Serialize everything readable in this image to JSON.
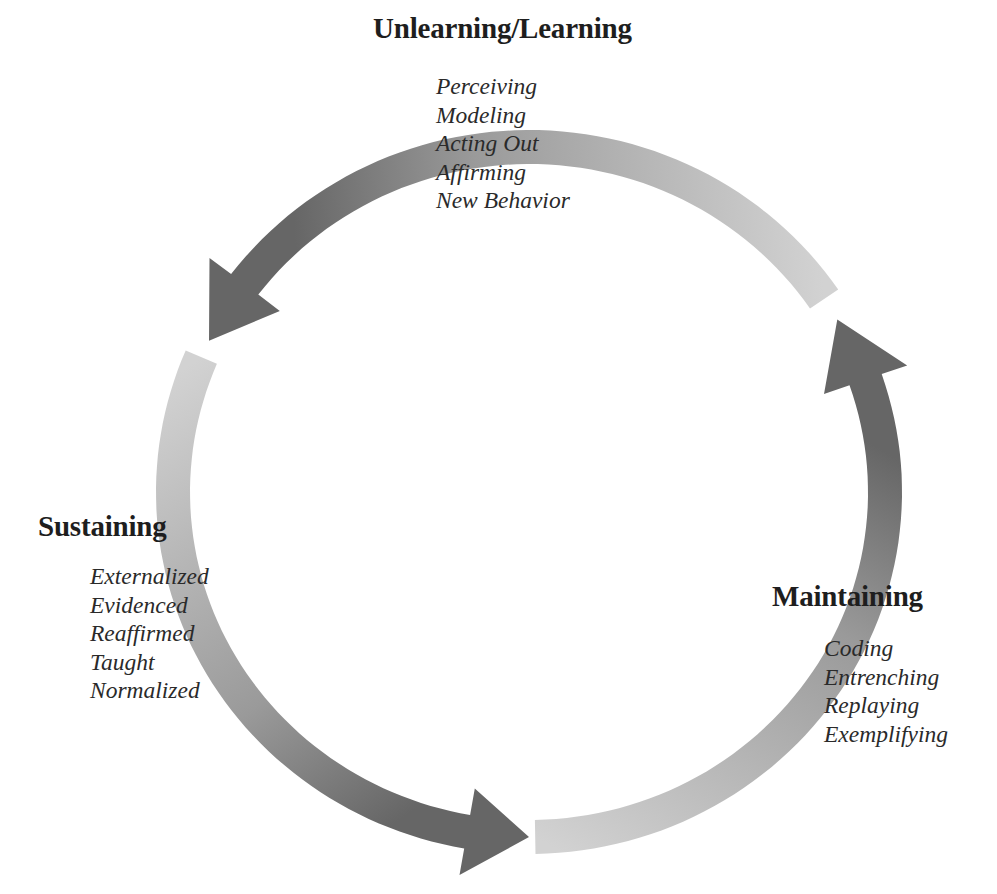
{
  "diagram": {
    "type": "cycle",
    "geometry": {
      "center": [
        529,
        492
      ],
      "rx": 356,
      "ry": 345,
      "band_width": 34,
      "arrowhead_half_width": 44
    },
    "colors": {
      "arrow_dark": "#666666",
      "arrow_light": "#d2d2d2",
      "title_text": "#1e1e1e",
      "item_text": "#2a2a2a"
    },
    "arrows": [
      {
        "id": "unlearning-to-sustaining",
        "start_deg": -34,
        "head_base_deg": -143,
        "tip_deg": -154
      },
      {
        "id": "sustaining-to-maintaining",
        "start_deg": -157,
        "head_base_deg": -260,
        "tip_deg": -270
      },
      {
        "id": "maintaining-to-unlearning",
        "start_deg": 89,
        "head_base_deg": -19,
        "tip_deg": -30
      }
    ],
    "stages": [
      {
        "title": "Unlearning/Learning",
        "items": [
          "Perceiving",
          "Modeling",
          "Acting Out",
          "Affirming",
          "New Behavior"
        ]
      },
      {
        "title": "Sustaining",
        "items": [
          "Externalized",
          "Evidenced",
          "Reaffirmed",
          "Taught",
          "Normalized"
        ]
      },
      {
        "title": "Maintaining",
        "items": [
          "Coding",
          "Entrenching",
          "Replaying",
          "Exemplifying"
        ]
      }
    ]
  }
}
